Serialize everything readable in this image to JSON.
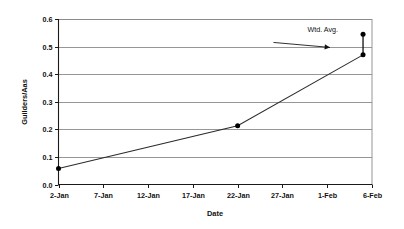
{
  "chart_data": {
    "type": "line",
    "title": "",
    "subtitle": "",
    "xlabel": "Date",
    "ylabel": "Guilders/Aas",
    "xlim": [
      0,
      35
    ],
    "ylim": [
      0.0,
      0.6
    ],
    "grid": "horizontal",
    "legend_position": "none",
    "x_tick_labels": [
      "2-Jan",
      "7-Jan",
      "12-Jan",
      "17-Jan",
      "22-Jan",
      "27-Jan",
      "1-Feb",
      "6-Feb"
    ],
    "x_tick_values": [
      0,
      5,
      10,
      15,
      20,
      25,
      30,
      35
    ],
    "y_tick_labels": [
      "0.0",
      "0.1",
      "0.2",
      "0.3",
      "0.4",
      "0.5",
      "0.6"
    ],
    "y_tick_values": [
      0.0,
      0.1,
      0.2,
      0.3,
      0.4,
      0.5,
      0.6
    ],
    "series": [
      {
        "name": "Wtd. Avg.",
        "x": [
          0,
          20,
          34
        ],
        "y": [
          0.058,
          0.213,
          0.47
        ],
        "marker": "filled-circle"
      },
      {
        "name": "Upper point",
        "x": [
          34,
          34
        ],
        "y": [
          0.47,
          0.545
        ],
        "marker": "filled-circle"
      }
    ],
    "data_points": [
      {
        "x_label": "2-Jan",
        "x": 0,
        "y": 0.058
      },
      {
        "x_label": "22-Jan",
        "x": 20,
        "y": 0.213
      },
      {
        "x_label": "6-Feb",
        "x": 34,
        "y": 0.47
      },
      {
        "x_label": "6-Feb",
        "x": 34,
        "y": 0.545
      }
    ],
    "annotations": [
      {
        "text": "Wtd. Avg.",
        "text_x": 29.5,
        "text_y": 0.552,
        "arrow_from_x": 24.0,
        "arrow_from_y": 0.515,
        "arrow_to_x": 30.3,
        "arrow_to_y": 0.497
      }
    ]
  },
  "axes": {
    "y_title": "Guilders/Aas",
    "x_title": "Date"
  }
}
